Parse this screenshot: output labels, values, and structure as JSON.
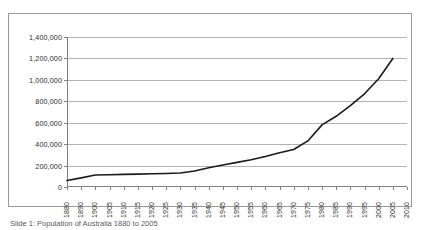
{
  "figure": {
    "caption": "Slide 1: Population of Australia 1880 to 2005"
  },
  "chart_data": {
    "type": "line",
    "title": "",
    "subtitle": "",
    "xlabel": "",
    "ylabel": "",
    "grid": "horizontal",
    "legend": "none",
    "xlim": [
      1880,
      2010
    ],
    "ylim": [
      0,
      1400000
    ],
    "ytick_labels": [
      "1,400,000",
      "1,200,000",
      "1,000,000",
      "800,000",
      "600,000",
      "400,000",
      "200,000",
      "0"
    ],
    "ytick_values": [
      1400000,
      1200000,
      1000000,
      800000,
      600000,
      400000,
      200000,
      0
    ],
    "xtick_labels": [
      "1880",
      "1890",
      "1900",
      "1905",
      "1910",
      "1915",
      "1920",
      "1925",
      "1930",
      "1935",
      "1940",
      "1945",
      "1950",
      "1955",
      "1960",
      "1965",
      "1970",
      "1975",
      "1980",
      "1985",
      "1990",
      "1995",
      "2000",
      "2005",
      "2010"
    ],
    "categories": [
      1880,
      1890,
      1900,
      1905,
      1910,
      1915,
      1920,
      1925,
      1930,
      1935,
      1940,
      1945,
      1950,
      1955,
      1960,
      1965,
      1970,
      1975,
      1980,
      1985,
      1990,
      1995,
      2000,
      2005
    ],
    "series": [
      {
        "name": "Population",
        "color": "#1a1a1a",
        "values": [
          60000,
          85000,
          112000,
          115000,
          118000,
          120000,
          123000,
          126000,
          130000,
          150000,
          180000,
          205000,
          230000,
          255000,
          285000,
          320000,
          350000,
          430000,
          580000,
          660000,
          760000,
          870000,
          1010000,
          1200000
        ]
      }
    ]
  },
  "colors": {
    "line": "#1a1a1a",
    "grid": "#b3b3b3",
    "axis": "#808080",
    "frame": "#9a9a9a",
    "text": "#2b2b2b"
  }
}
